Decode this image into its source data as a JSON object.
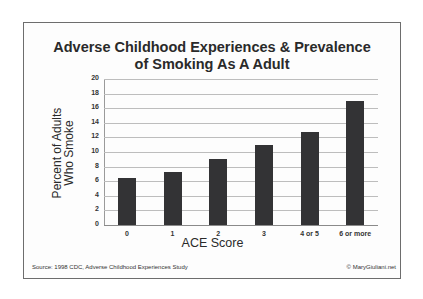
{
  "chart_data": {
    "type": "bar",
    "title": "Adverse Childhood Experiences & Prevalence of Smoking As A Adult",
    "title_lines": [
      "Adverse Childhood Experiences & Prevalence",
      "of Smoking As A Adult"
    ],
    "xlabel": "ACE Score",
    "ylabel": "Percent of Adults Who Smoke",
    "ylabel_lines": [
      "Percent of Adults",
      "Who Smoke"
    ],
    "categories": [
      "0",
      "1",
      "2",
      "3",
      "4 or 5",
      "6 or more"
    ],
    "values": [
      6.4,
      7.2,
      9.0,
      11.0,
      12.8,
      17.0
    ],
    "ylim": [
      0,
      20
    ],
    "yticks": [
      "0",
      "2",
      "4",
      "6",
      "8",
      "10",
      "12",
      "14",
      "16",
      "18",
      "20"
    ],
    "grid": true,
    "legend": null,
    "bar_color": "#333335"
  },
  "footer": {
    "source": "Source: 1998 CDC, Adverse Childhood Experiences Study",
    "credit": "© MaryGiuliani.net"
  }
}
